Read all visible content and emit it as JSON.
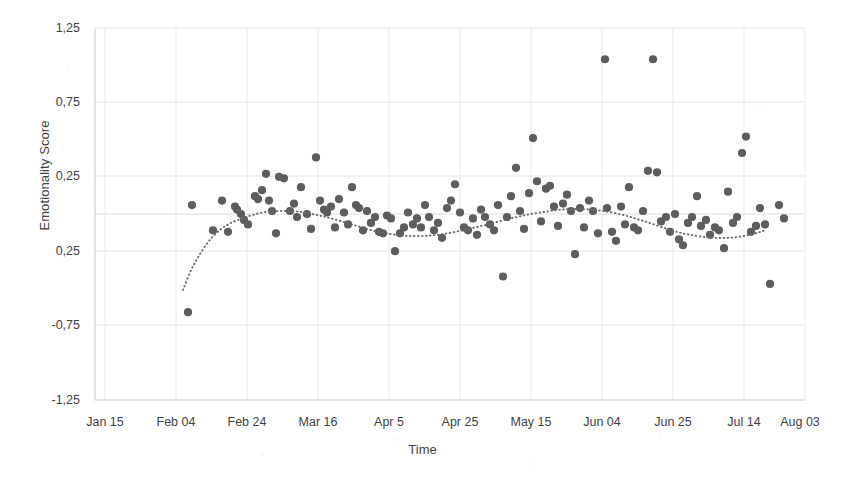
{
  "chart_data": {
    "type": "scatter",
    "title": "",
    "subtitle": "",
    "xlabel": "Time",
    "ylabel": "Emotionality Score",
    "grid": true,
    "legend": null,
    "legend_position": "none",
    "point_color": "#5d5d5d",
    "point_radius_px": 4.1,
    "trendline": {
      "name": "smoothed trend",
      "style": "dotted",
      "color": "#6b6b6b",
      "note": "LOESS-style smoother drawn as a dotted curve over the scatter"
    },
    "axis_background": "#ffffff",
    "gridline_color": "#e3e3e3",
    "ylim": [
      -1.25,
      1.25
    ],
    "ytick_values": [
      1.25,
      0.75,
      0.25,
      -0.25,
      -0.75,
      -1.25
    ],
    "ytick_labels": [
      "1,25",
      "0,75",
      "0,25",
      "0,25",
      "-0,75",
      "-1,25"
    ],
    "ytick_label_note": "the fourth label is rendered as '0,25' in the source image (the minus sign is absent)",
    "xtick_labels": [
      "Jan 15",
      "Feb 04",
      "Feb 24",
      "Mar 16",
      "Apr 5",
      "Apr 25",
      "May 15",
      "Jun 04",
      "Jun 25",
      "Jul 14",
      "Aug 03"
    ],
    "xtick_positions_px": [
      105,
      176,
      247,
      318,
      389,
      460,
      531,
      602,
      673,
      744,
      800
    ],
    "decimal_separator": "comma",
    "points": [
      [
        192,
        0.06
      ],
      [
        188,
        -0.66
      ],
      [
        213,
        -0.11
      ],
      [
        222,
        0.09
      ],
      [
        228,
        -0.12
      ],
      [
        235,
        0.05
      ],
      [
        237,
        0.03
      ],
      [
        241,
        0.0
      ],
      [
        244,
        -0.04
      ],
      [
        248,
        -0.07
      ],
      [
        255,
        0.12
      ],
      [
        258,
        0.1
      ],
      [
        262,
        0.16
      ],
      [
        266,
        0.27
      ],
      [
        269,
        0.09
      ],
      [
        272,
        0.02
      ],
      [
        276,
        -0.13
      ],
      [
        279,
        0.25
      ],
      [
        284,
        0.24
      ],
      [
        290,
        0.02
      ],
      [
        294,
        0.07
      ],
      [
        297,
        -0.02
      ],
      [
        301,
        0.18
      ],
      [
        307,
        0.0
      ],
      [
        311,
        -0.1
      ],
      [
        316,
        0.38
      ],
      [
        320,
        0.09
      ],
      [
        324,
        0.03
      ],
      [
        327,
        0.01
      ],
      [
        331,
        0.05
      ],
      [
        335,
        -0.09
      ],
      [
        339,
        0.1
      ],
      [
        344,
        0.01
      ],
      [
        348,
        -0.07
      ],
      [
        352,
        0.18
      ],
      [
        356,
        0.06
      ],
      [
        359,
        0.04
      ],
      [
        363,
        -0.11
      ],
      [
        367,
        0.02
      ],
      [
        371,
        -0.06
      ],
      [
        375,
        -0.02
      ],
      [
        379,
        -0.12
      ],
      [
        383,
        -0.13
      ],
      [
        387,
        -0.01
      ],
      [
        391,
        -0.03
      ],
      [
        395,
        -0.25
      ],
      [
        400,
        -0.13
      ],
      [
        404,
        -0.09
      ],
      [
        408,
        0.01
      ],
      [
        413,
        -0.07
      ],
      [
        417,
        -0.03
      ],
      [
        421,
        -0.09
      ],
      [
        425,
        0.06
      ],
      [
        429,
        -0.02
      ],
      [
        434,
        -0.11
      ],
      [
        438,
        -0.06
      ],
      [
        442,
        -0.16
      ],
      [
        447,
        0.04
      ],
      [
        451,
        0.09
      ],
      [
        455,
        0.2
      ],
      [
        460,
        0.01
      ],
      [
        464,
        -0.09
      ],
      [
        468,
        -0.11
      ],
      [
        473,
        -0.03
      ],
      [
        477,
        -0.14
      ],
      [
        481,
        0.03
      ],
      [
        485,
        -0.02
      ],
      [
        490,
        -0.07
      ],
      [
        494,
        -0.11
      ],
      [
        498,
        0.06
      ],
      [
        503,
        -0.42
      ],
      [
        507,
        -0.02
      ],
      [
        511,
        0.12
      ],
      [
        516,
        0.31
      ],
      [
        520,
        0.02
      ],
      [
        524,
        -0.1
      ],
      [
        529,
        0.14
      ],
      [
        533,
        0.51
      ],
      [
        537,
        0.22
      ],
      [
        541,
        -0.05
      ],
      [
        546,
        0.17
      ],
      [
        550,
        0.19
      ],
      [
        554,
        0.05
      ],
      [
        558,
        -0.08
      ],
      [
        563,
        0.07
      ],
      [
        567,
        0.13
      ],
      [
        571,
        0.02
      ],
      [
        575,
        -0.27
      ],
      [
        580,
        0.04
      ],
      [
        584,
        -0.09
      ],
      [
        589,
        0.09
      ],
      [
        593,
        0.02
      ],
      [
        598,
        -0.13
      ],
      [
        605,
        1.04
      ],
      [
        607,
        0.04
      ],
      [
        612,
        -0.12
      ],
      [
        616,
        -0.18
      ],
      [
        621,
        0.05
      ],
      [
        625,
        -0.07
      ],
      [
        629,
        0.18
      ],
      [
        634,
        -0.09
      ],
      [
        638,
        -0.11
      ],
      [
        643,
        0.02
      ],
      [
        648,
        0.29
      ],
      [
        653,
        1.04
      ],
      [
        657,
        0.28
      ],
      [
        661,
        -0.05
      ],
      [
        666,
        -0.02
      ],
      [
        670,
        -0.12
      ],
      [
        675,
        0.0
      ],
      [
        679,
        -0.17
      ],
      [
        683,
        -0.21
      ],
      [
        688,
        -0.06
      ],
      [
        692,
        -0.02
      ],
      [
        697,
        0.12
      ],
      [
        701,
        -0.08
      ],
      [
        706,
        -0.04
      ],
      [
        710,
        -0.14
      ],
      [
        715,
        -0.09
      ],
      [
        719,
        -0.11
      ],
      [
        724,
        -0.23
      ],
      [
        728,
        0.15
      ],
      [
        733,
        -0.06
      ],
      [
        737,
        -0.02
      ],
      [
        742,
        0.41
      ],
      [
        746,
        0.52
      ],
      [
        751,
        -0.12
      ],
      [
        756,
        -0.08
      ],
      [
        760,
        0.04
      ],
      [
        765,
        -0.07
      ],
      [
        770,
        -0.47
      ],
      [
        779,
        0.06
      ],
      [
        784,
        -0.03
      ]
    ],
    "trend_path_px": [
      [
        183,
        290
      ],
      [
        190,
        272
      ],
      [
        198,
        257
      ],
      [
        207,
        243
      ],
      [
        217,
        232
      ],
      [
        228,
        224
      ],
      [
        240,
        219
      ],
      [
        252,
        215
      ],
      [
        264,
        212
      ],
      [
        277,
        211
      ],
      [
        290,
        211
      ],
      [
        303,
        212
      ],
      [
        317,
        215
      ],
      [
        330,
        218
      ],
      [
        344,
        222
      ],
      [
        357,
        226
      ],
      [
        370,
        230
      ],
      [
        384,
        233
      ],
      [
        397,
        235
      ],
      [
        410,
        236
      ],
      [
        424,
        236
      ],
      [
        437,
        235
      ],
      [
        450,
        233
      ],
      [
        464,
        230
      ],
      [
        477,
        227
      ],
      [
        490,
        224
      ],
      [
        504,
        220
      ],
      [
        517,
        217
      ],
      [
        530,
        214
      ],
      [
        544,
        212
      ],
      [
        557,
        210
      ],
      [
        570,
        209
      ],
      [
        584,
        209
      ],
      [
        597,
        210
      ],
      [
        610,
        212
      ],
      [
        624,
        215
      ],
      [
        637,
        219
      ],
      [
        650,
        223
      ],
      [
        664,
        228
      ],
      [
        677,
        232
      ],
      [
        690,
        235
      ],
      [
        704,
        237
      ],
      [
        717,
        238
      ],
      [
        730,
        238
      ],
      [
        744,
        236
      ],
      [
        757,
        233
      ],
      [
        766,
        230
      ]
    ]
  }
}
